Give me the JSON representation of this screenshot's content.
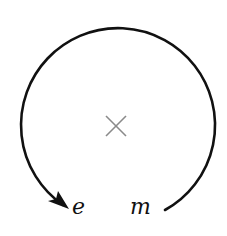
{
  "diagram": {
    "type": "circular-arrow",
    "center_marker": "×",
    "labels": {
      "start": "m",
      "end": "e"
    },
    "colors": {
      "arc": "#111111",
      "marker": "#8a8a8a",
      "background": "#ffffff"
    }
  }
}
